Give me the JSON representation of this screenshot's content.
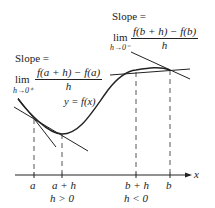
{
  "left_annotation": {
    "slope_label": "Slope =",
    "lim": "lim",
    "lim_sub": "h→0⁺",
    "numerator": "f(a + h) − f(a)",
    "denominator": "h"
  },
  "right_annotation": {
    "slope_label": "Slope =",
    "lim": "lim",
    "lim_sub": "h→0⁻",
    "numerator": "f(b + h) − f(b)",
    "denominator": "h"
  },
  "curve_label": "y = f(x)",
  "axis": {
    "x_label": "x",
    "ticks": [
      {
        "label": "a",
        "x": 34
      },
      {
        "label": "a + h",
        "x": 62
      },
      {
        "label": "b + h",
        "x": 136
      },
      {
        "label": "b",
        "x": 170
      }
    ],
    "conditions": [
      {
        "label": "h > 0",
        "x": 62
      },
      {
        "label": "h < 0",
        "x": 136
      }
    ]
  },
  "colors": {
    "ink": "#222222",
    "background": "#ffffff"
  }
}
